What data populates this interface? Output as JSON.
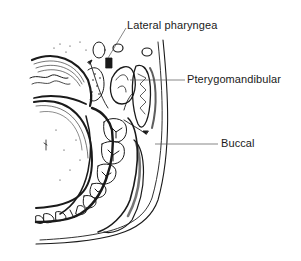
{
  "figure": {
    "type": "anatomical cross-section line drawing",
    "colors": {
      "background": "#ffffff",
      "ink": "#1a1a1a",
      "leader_line": "#555555"
    },
    "labels": [
      {
        "id": "lateral-pharyngeal",
        "text": "Lateral pharyngea",
        "x": 127,
        "y": 19,
        "leader": {
          "x1": 126,
          "y1": 28,
          "x2": 108,
          "y2": 58
        }
      },
      {
        "id": "pterygomandibular",
        "text": "Pterygomandibular",
        "x": 187,
        "y": 73,
        "leader": {
          "x1": 130,
          "y1": 80,
          "x2": 185,
          "y2": 80
        }
      },
      {
        "id": "buccal",
        "text": "Buccal",
        "x": 221,
        "y": 137,
        "leader": {
          "x1": 155,
          "y1": 144,
          "x2": 218,
          "y2": 144
        }
      }
    ]
  }
}
